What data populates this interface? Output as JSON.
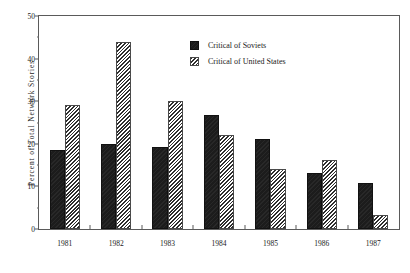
{
  "chart_data": {
    "type": "bar",
    "title": "",
    "subtitle": "",
    "xlabel": "",
    "ylabel": "Percent of Total Network Stories",
    "categories": [
      "1981",
      "1982",
      "1983",
      "1984",
      "1985",
      "1986",
      "1987"
    ],
    "series": [
      {
        "name": "Critical of Soviets",
        "fill": "solid-black",
        "color": "#1c1c1c",
        "values": [
          18.5,
          20.0,
          19.2,
          26.8,
          21.1,
          13.2,
          10.7
        ]
      },
      {
        "name": "Critical of United States",
        "fill": "diagonal-hatch",
        "color": "#2e2e2e",
        "values": [
          29.0,
          43.8,
          30.0,
          22.0,
          14.1,
          16.3,
          3.4
        ]
      }
    ],
    "ylim": [
      0,
      50
    ],
    "y_major_ticks": [
      0,
      10,
      20,
      30,
      40,
      50
    ],
    "y_tick_labels": [
      "0",
      "10",
      "20",
      "30",
      "40",
      "50"
    ],
    "y_minor_ticks": [
      5,
      15,
      25,
      35,
      45
    ],
    "grid": false,
    "legend_position": "upper-right-inside",
    "frame": true
  }
}
